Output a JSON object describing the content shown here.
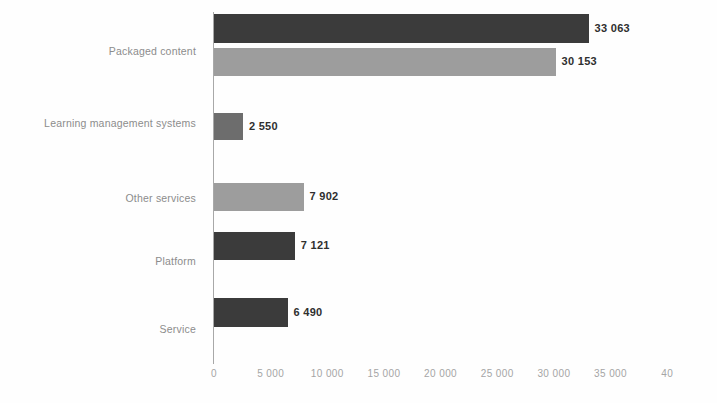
{
  "chart_data": {
    "type": "bar",
    "orientation": "horizontal",
    "title": "",
    "subtitle": "",
    "xlabel": "",
    "ylabel": "",
    "xlim": [
      0,
      40000
    ],
    "grid": false,
    "legend": "none",
    "categories": [
      "Packaged content",
      "Learning management systems",
      "Other services",
      "Platform",
      "Service"
    ],
    "bars": [
      {
        "category": "Packaged content",
        "value": 33063,
        "label": "33 063",
        "color": "#3b3b3b",
        "shade": "dark"
      },
      {
        "category": "Packaged content",
        "value": 30153,
        "label": "30 153",
        "color": "#9d9d9d",
        "shade": "light"
      },
      {
        "category": "Learning management systems",
        "value": 2550,
        "label": "2 550",
        "color": "#6d6d6d",
        "shade": "mid"
      },
      {
        "category": "Other services",
        "value": 7902,
        "label": "7 902",
        "color": "#9d9d9d",
        "shade": "light"
      },
      {
        "category": "Platform",
        "value": 7121,
        "label": "7 121",
        "color": "#3b3b3b",
        "shade": "dark"
      },
      {
        "category": "Service",
        "value": 6490,
        "label": "6 490",
        "color": "#3b3b3b",
        "shade": "dark"
      }
    ],
    "xticks": [
      {
        "value": 0,
        "label": "0"
      },
      {
        "value": 5000,
        "label": "5 000"
      },
      {
        "value": 10000,
        "label": "10 000"
      },
      {
        "value": 15000,
        "label": "15 000"
      },
      {
        "value": 20000,
        "label": "20 000"
      },
      {
        "value": 25000,
        "label": "25 000"
      },
      {
        "value": 30000,
        "label": "30 000"
      },
      {
        "value": 35000,
        "label": "35 000"
      },
      {
        "value": 40000,
        "label": "40"
      }
    ],
    "category_labels": [
      {
        "text": "Packaged content",
        "y": 45
      },
      {
        "text": "Learning management systems",
        "y": 117
      },
      {
        "text": "Other services",
        "y": 192
      },
      {
        "text": "Platform",
        "y": 255
      },
      {
        "text": "Service",
        "y": 323
      }
    ],
    "bar_geometry": [
      {
        "top": 14,
        "height": 29
      },
      {
        "top": 48,
        "height": 28
      },
      {
        "top": 113,
        "height": 27
      },
      {
        "top": 183,
        "height": 28
      },
      {
        "top": 232,
        "height": 28
      },
      {
        "top": 298,
        "height": 29
      }
    ],
    "axis": {
      "origin_x": 214,
      "px_per_unit": 0.01133,
      "value_axis_color": "#a8a8a8",
      "tick_label_color": "#a5a5a5",
      "category_label_color": "#8c8c8c",
      "value_label_color": "#2f2f2f"
    }
  }
}
